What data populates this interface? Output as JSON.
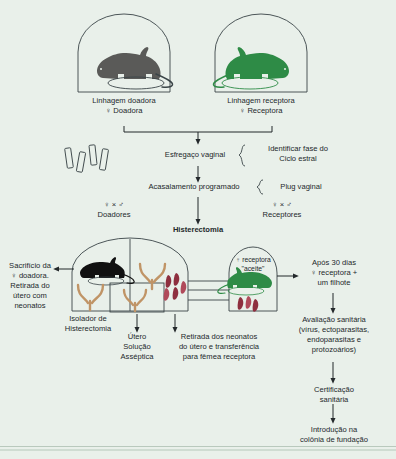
{
  "diagram": {
    "background_color": "#e9f0ea",
    "colors": {
      "donor_mouse": "#5a5a58",
      "recipient_mouse": "#2e8b46",
      "uterus": "#c8a67f",
      "neonate": "#8e2f3f",
      "line": "#3a4447",
      "text": "#23282b"
    }
  },
  "top": {
    "donor_cage": {
      "icon": "mouse-silhouette-gray",
      "line1": "Linhagem doadora",
      "line2": "♀ Doadora"
    },
    "recipient_cage": {
      "icon": "mouse-silhouette-green",
      "line1": "Linhagem receptora",
      "line2": "♀ Receptora"
    }
  },
  "steps": {
    "smear": {
      "label": "Esfregaço vaginal",
      "brace_line1": "Identificar fase do",
      "brace_line2": "Ciclo estral",
      "slides_icon": "microscope-slides"
    },
    "mating": {
      "label": "Acasalamento programado",
      "brace_line1": "Plug vaginal"
    },
    "donors_pair": {
      "symbols": "♀ × ♂",
      "label": "Doadores"
    },
    "recipients_pair": {
      "symbols": "♀ × ♂",
      "label": "Receptores"
    },
    "hysterectomy": {
      "label": "Histerectomia"
    }
  },
  "isolator": {
    "sacrifice": {
      "line1": "Sacrifício da",
      "line2": "♀ doadora.",
      "line3": "Retirada do",
      "line4": "útero com",
      "line5": "neonatos"
    },
    "isolator_caption": {
      "line1": "Isolador de",
      "line2": "Histerectomia"
    },
    "uterus_solution": {
      "line1": "Útero",
      "line2": "Solução",
      "line3": "Asséptica"
    },
    "transfer": {
      "line1": "Retirada dos neonatos",
      "line2": "do útero e transferência",
      "line3": "para fêmea receptora"
    },
    "recipient_accepts": {
      "line1": "♀ receptora",
      "line2": "\"aceite\""
    }
  },
  "right_chain": {
    "after_30_days": {
      "line1": "Após 30 dias",
      "line2": "♀ receptora +",
      "line3": "um filhote"
    },
    "sanitary_eval": {
      "line1": "Avaliação sanitária",
      "line2": "(vírus, ectoparasitas,",
      "line3": "endoparasitas e",
      "line4": "protozoários)"
    },
    "certification": {
      "line1": "Certificação",
      "line2": "sanitária"
    },
    "introduction": {
      "line1": "Introdução na",
      "line2": "colônia de fundação"
    }
  }
}
